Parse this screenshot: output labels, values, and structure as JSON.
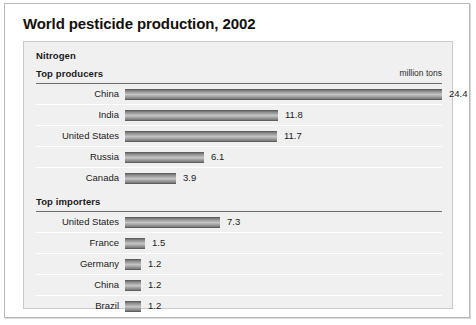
{
  "title": "World pesticide production, 2002",
  "group": {
    "name": "Nitrogen"
  },
  "sections": [
    {
      "heading": "Top producers",
      "unit": "million tons",
      "rows": [
        {
          "label": "China",
          "value": "24.4"
        },
        {
          "label": "India",
          "value": "11.8"
        },
        {
          "label": "United States",
          "value": "11.7"
        },
        {
          "label": "Russia",
          "value": "6.1"
        },
        {
          "label": "Canada",
          "value": "3.9"
        }
      ]
    },
    {
      "heading": "Top importers",
      "unit": "",
      "rows": [
        {
          "label": "United States",
          "value": "7.3"
        },
        {
          "label": "France",
          "value": "1.5"
        },
        {
          "label": "Germany",
          "value": "1.2"
        },
        {
          "label": "China",
          "value": "1.2"
        },
        {
          "label": "Brazil",
          "value": "1.2"
        }
      ]
    }
  ],
  "chart_data": {
    "type": "bar",
    "title": "World pesticide production, 2002",
    "subtitle": "Nitrogen",
    "xlabel": "million tons",
    "ylabel": "",
    "orientation": "horizontal",
    "unit": "million tons",
    "grid": false,
    "legend": "none",
    "xlim": [
      0,
      24.4
    ],
    "panels": [
      {
        "name": "Top producers",
        "categories": [
          "China",
          "India",
          "United States",
          "Russia",
          "Canada"
        ],
        "values": [
          24.4,
          11.8,
          11.7,
          6.1,
          3.9
        ]
      },
      {
        "name": "Top importers",
        "categories": [
          "United States",
          "France",
          "Germany",
          "China",
          "Brazil"
        ],
        "values": [
          7.3,
          1.5,
          1.2,
          1.2,
          1.2
        ]
      }
    ]
  },
  "scale": {
    "px_per_unit": 13.0,
    "value_gap_px": 7
  },
  "colors": {
    "page_background": "#ffffff",
    "panel_background": "#f0f0f0",
    "panel_border": "#c9c9c9",
    "outer_border": "#b9b9b9",
    "rule": "#6d6d6d",
    "row_separator": "#ffffff",
    "text": "#1b1b1b",
    "title_text": "#14100d",
    "bar_light": "#c6c6c6",
    "bar_dark": "#6f6f6f",
    "bar_edge": "#5f5f5f"
  }
}
